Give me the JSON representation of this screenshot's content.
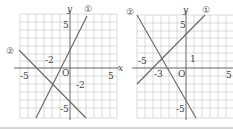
{
  "graphs": [
    {
      "id": "left",
      "axis_x_label": "x",
      "axis_y_label": "y",
      "origin_label": "O",
      "tick_labels": {
        "x_neg": "-5",
        "x_pos": "5",
        "y_pos": "5",
        "y_neg": "-5",
        "y_intercept": "-2",
        "x_intercept": "-2"
      },
      "lines": [
        {
          "label": "①"
        },
        {
          "label": "②"
        }
      ]
    },
    {
      "id": "right",
      "axis_y_label": "y",
      "origin_label": "O",
      "tick_labels": {
        "x_neg": "-5",
        "x_pos": "5",
        "y_pos": "5",
        "y_neg": "-5",
        "y_one": "1",
        "x_neg3": "-3"
      },
      "lines": [
        {
          "label": "①"
        },
        {
          "label": "②"
        }
      ]
    }
  ],
  "colors": {
    "grid": "#bdbdbd",
    "axis": "#555555",
    "line": "#666666",
    "text": "#444444"
  }
}
